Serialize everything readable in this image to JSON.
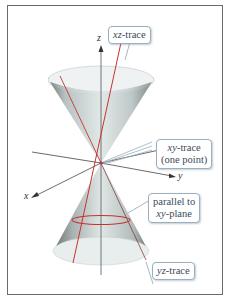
{
  "figure": {
    "axes": {
      "z": "z",
      "x": "x",
      "y": "y"
    },
    "callouts": {
      "xz_trace": {
        "var": "xz",
        "text": "-trace"
      },
      "xy_trace": {
        "var": "xy",
        "text": "-trace",
        "line2": "(one point)"
      },
      "parallel": {
        "line1": "parallel to",
        "var": "xy",
        "text": "-plane"
      },
      "yz_trace": {
        "var": "yz",
        "text": "-trace"
      }
    },
    "colors": {
      "trace": "#c8332e",
      "surface": "#d4dcdc",
      "surface_shade": "#7d8a88",
      "axis": "#444444",
      "callout_border": "#9ab0c0"
    }
  }
}
